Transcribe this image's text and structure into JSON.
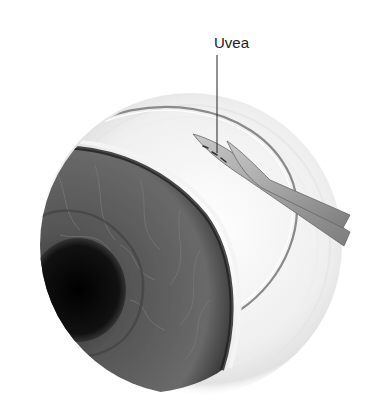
{
  "figure": {
    "labels": [
      {
        "id": "uvea",
        "text": "Uvea"
      }
    ]
  },
  "colors": {
    "background": "#ffffff",
    "sclera": "#f2f2f2",
    "iris": "#5a5a5a",
    "pupil": "#0c0c0c",
    "instrument": "#9a9a9a",
    "outline": "#8a8a8a"
  }
}
